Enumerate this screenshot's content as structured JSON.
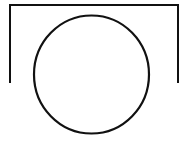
{
  "diagram": {
    "background": "#ffffff",
    "stroke_color": "#111111",
    "stroke_width": 2,
    "shapes": [
      {
        "id": "frame",
        "type": "polyline",
        "description": "inverted U-shaped bracket frame",
        "points": [
          [
            10,
            83
          ],
          [
            10,
            5
          ],
          [
            178,
            5
          ],
          [
            178,
            83
          ]
        ]
      },
      {
        "id": "circle",
        "type": "ellipse",
        "description": "circle below the frame top",
        "cx": 91.5,
        "cy": 74.5,
        "rx": 57.5,
        "ry": 59
      }
    ]
  }
}
